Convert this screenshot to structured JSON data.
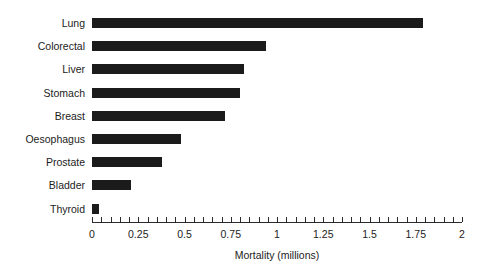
{
  "chart_data": {
    "type": "bar",
    "orientation": "horizontal",
    "title": "",
    "xlabel": "Mortality (millions)",
    "ylabel": "",
    "xlim": [
      0,
      2
    ],
    "grid": false,
    "legend": null,
    "categories": [
      "Lung",
      "Colorectal",
      "Liver",
      "Stomach",
      "Breast",
      "Oesophagus",
      "Prostate",
      "Bladder",
      "Thyroid"
    ],
    "values": [
      1.79,
      0.94,
      0.82,
      0.8,
      0.72,
      0.48,
      0.38,
      0.21,
      0.04
    ],
    "bar_color": "#1b1b1b",
    "x_major_ticks": [
      0,
      0.25,
      0.5,
      0.75,
      1,
      1.25,
      1.5,
      1.75,
      2
    ],
    "x_major_tick_labels": [
      "0",
      "0.25",
      "0.5",
      "0.75",
      "1",
      "1.25",
      "1.5",
      "1.75",
      "2"
    ],
    "x_minor_tick_interval": 0.05,
    "background_color": "#ffffff",
    "axis_color": "#2b2b2b"
  }
}
